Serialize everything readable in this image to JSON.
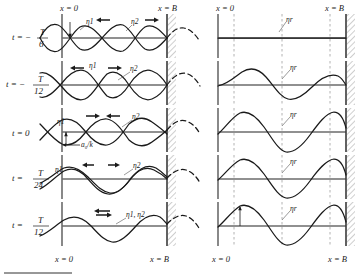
{
  "figure": {
    "title_none": "",
    "axis_labels": {
      "x0": "x = 0",
      "xB": "x = B"
    },
    "series_labels": {
      "eta1": "η1",
      "eta2": "η2",
      "eta_both": "η1, η2",
      "eta_r": "ηr"
    },
    "amplitude_label": "a₀/k",
    "rows": [
      {
        "time_prefix": "t = −",
        "time_num": "T",
        "time_den": "6",
        "time_full": "t = −T/6",
        "left_labels": [
          "η1",
          "η2"
        ],
        "left_arrows": [
          "left",
          "right"
        ],
        "right_label": "ηr",
        "right_amplitude": 0.0,
        "phase_deg": -120
      },
      {
        "time_prefix": "t = −",
        "time_num": "T",
        "time_den": "12",
        "time_full": "t = −T/12",
        "left_labels": [
          "η1",
          "η2"
        ],
        "left_arrows": [
          "left",
          "right"
        ],
        "right_label": "ηr",
        "right_amplitude": 0.5,
        "phase_deg": -60
      },
      {
        "time_prefix": "t = ",
        "time_num": "",
        "time_den": "",
        "time_full": "t = 0",
        "left_labels": [
          "η1",
          "η2"
        ],
        "left_arrows": [
          "right",
          "left"
        ],
        "right_label": "ηr",
        "right_amplitude": 0.866,
        "phase_deg": 0
      },
      {
        "time_prefix": "t = ",
        "time_num": "T",
        "time_den": "24",
        "time_full": "t = T/24",
        "left_labels": [
          "η1",
          "η2"
        ],
        "left_arrows": [
          "left",
          "right"
        ],
        "right_label": "ηr",
        "right_amplitude": 0.966,
        "phase_deg": 30
      },
      {
        "time_prefix": "t = ",
        "time_num": "T",
        "time_den": "12",
        "time_full": "t = T/12",
        "left_labels": [
          "η1, η2"
        ],
        "left_arrows": [
          "both"
        ],
        "right_label": "ηr",
        "right_amplitude": 1.0,
        "phase_deg": 60
      }
    ],
    "bottom_axis": {
      "left_x0": "x = 0",
      "left_xB": "x = B",
      "right_x0": "x = 0",
      "right_xB": "x = B"
    },
    "colors": {
      "curve": "#1a1a1a",
      "baseline": "#6b6b6b",
      "node_dash": "#9a9a9a",
      "wall": "#3a3a3a",
      "background": "#ffffff"
    }
  }
}
